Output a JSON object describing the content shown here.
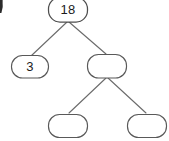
{
  "figure": {
    "type": "tree",
    "background_color": "#ffffff",
    "node_fill": "#ffffff",
    "node_stroke": "#595959",
    "edge_stroke": "#6b6b6b",
    "text_color": "#1c1c1c"
  },
  "tree": {
    "nodes": [
      {
        "id": "root",
        "label": "18",
        "empty": false,
        "x": 48,
        "y": 0,
        "width": 40,
        "height": 23,
        "rx": 11,
        "level": 0
      },
      {
        "id": "left-child",
        "label": "3",
        "empty": false,
        "x": 11,
        "y": 55,
        "width": 38,
        "height": 23,
        "rx": 11,
        "level": 1
      },
      {
        "id": "right-child",
        "label": "",
        "empty": true,
        "x": 87,
        "y": 54,
        "width": 40,
        "height": 24,
        "rx": 11,
        "level": 1
      },
      {
        "id": "grandchild-left",
        "label": "",
        "empty": true,
        "x": 48,
        "y": 114,
        "width": 40,
        "height": 24,
        "rx": 11,
        "level": 2
      },
      {
        "id": "grandchild-right",
        "label": "",
        "empty": true,
        "x": 127,
        "y": 114,
        "width": 40,
        "height": 24,
        "rx": 11,
        "level": 2
      }
    ],
    "edges": [
      {
        "id": "root-to-left",
        "from": "root",
        "to": "left-child",
        "x1": 67,
        "y1": 22,
        "x2": 31,
        "y2": 56
      },
      {
        "id": "root-to-right",
        "from": "root",
        "to": "right-child",
        "x1": 69,
        "y1": 22,
        "x2": 106,
        "y2": 54
      },
      {
        "id": "right-to-left",
        "from": "right-child",
        "to": "grandchild-left",
        "x1": 106,
        "y1": 78,
        "x2": 69,
        "y2": 113
      },
      {
        "id": "right-to-right",
        "from": "right-child",
        "to": "grandchild-right",
        "x1": 108,
        "y1": 78,
        "x2": 146,
        "y2": 113
      }
    ]
  },
  "artifacts": {
    "scan_edge_sliver": {
      "name": "page-edge-artifact",
      "x": 0,
      "y": 0,
      "width": 3,
      "height": 13
    }
  }
}
